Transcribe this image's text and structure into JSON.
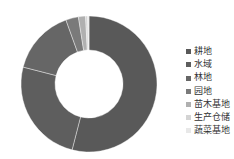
{
  "chart_data": {
    "type": "pie",
    "subtype": "donut",
    "title": "",
    "categories": [
      "耕地",
      "水域",
      "林地",
      "园地",
      "苗木基地",
      "生产仓储",
      "蔬菜基地"
    ],
    "values": [
      54.0,
      25.0,
      15.5,
      3.0,
      1.7,
      0.5,
      0.3
    ],
    "colors": [
      "#595959",
      "#5e5e5e",
      "#666666",
      "#7a7a7a",
      "#b0b0b0",
      "#d4d4d4",
      "#e8e8e8"
    ],
    "legend_position": "right",
    "inner_radius_ratio": 0.5
  },
  "legend": {
    "items": [
      {
        "label": "耕地",
        "color": "#595959"
      },
      {
        "label": "水域",
        "color": "#5e5e5e"
      },
      {
        "label": "林地",
        "color": "#666666"
      },
      {
        "label": "园地",
        "color": "#7a7a7a"
      },
      {
        "label": "苗木基地",
        "color": "#b0b0b0"
      },
      {
        "label": "生产仓储",
        "color": "#d4d4d4"
      },
      {
        "label": "蔬菜基地",
        "color": "#e8e8e8"
      }
    ]
  }
}
